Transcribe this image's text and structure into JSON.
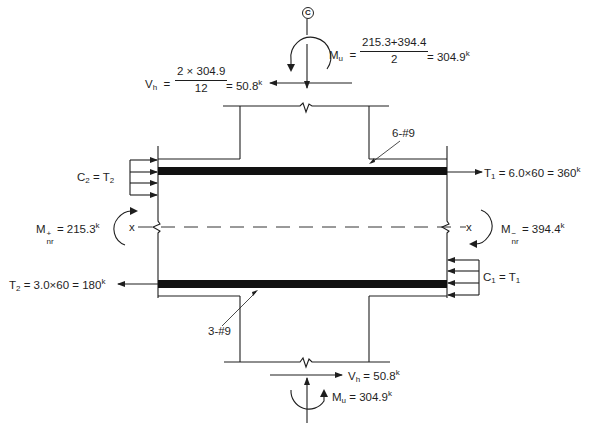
{
  "figure": {
    "type": "beam-column joint free body diagram",
    "centerline_marker": "C",
    "colors": {
      "ink": "#1e1e1e",
      "bar_fill": "#111111",
      "background": "#ffffff"
    }
  },
  "top": {
    "moment": {
      "symbol": "M",
      "subscript": "u",
      "numerator": "215.3+394.4",
      "denominator": "2",
      "result": "= 304.9",
      "unit": "k"
    },
    "shear": {
      "symbol": "V",
      "subscript": "h",
      "eq": "=",
      "numerator": "2 × 304.9",
      "denominator": "12",
      "result": "= 50.8",
      "unit": "k"
    }
  },
  "beam": {
    "top_bar_label": "6-#9",
    "bottom_bar_label": "3-#9",
    "left": {
      "compression": {
        "symbol": "C",
        "sub": "2",
        "eq": " = ",
        "rhs": "T",
        "rhs_sub": "2"
      },
      "tension": {
        "symbol": "T",
        "sub": "2",
        "text": " = 3.0×60 = 180",
        "unit": "k"
      },
      "moment": {
        "symbol": "M",
        "sup": "+",
        "sub": "nr",
        "text": " = 215.3",
        "unit": "k"
      },
      "axis_label": "x"
    },
    "right": {
      "compression": {
        "symbol": "C",
        "sub": "1",
        "eq": " = ",
        "rhs": "T",
        "rhs_sub": "1"
      },
      "tension": {
        "symbol": "T",
        "sub": "1",
        "text": " = 6.0×60 = 360",
        "unit": "k"
      },
      "moment": {
        "symbol": "M",
        "sup": "−",
        "sub": "nr",
        "text": " = 394.4",
        "unit": "k"
      },
      "axis_label": "x"
    }
  },
  "bottom": {
    "shear": {
      "symbol": "V",
      "subscript": "h",
      "text": " = 50.8",
      "unit": "k"
    },
    "moment": {
      "symbol": "M",
      "subscript": "u",
      "text": " = 304.9",
      "unit": "k"
    }
  }
}
